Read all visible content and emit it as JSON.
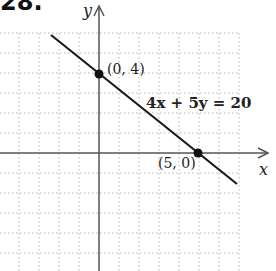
{
  "problem_number": "28.",
  "graph": {
    "equation_label": "4x + 5y = 20",
    "x_axis_label": "x",
    "y_axis_label": "y",
    "points": [
      {
        "label": "(0, 4)",
        "x": 0,
        "y": 4
      },
      {
        "label": "(5, 0)",
        "x": 5,
        "y": 0
      }
    ],
    "grid_unit_px": 20,
    "colors": {
      "line": "#1a1a1a",
      "grid": "#b0b0b0",
      "axis": "#555555"
    }
  }
}
